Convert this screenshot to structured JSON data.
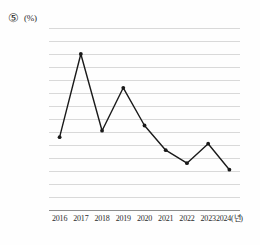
{
  "header": {
    "item_number": "⑤",
    "unit_label": "(%)"
  },
  "chart_data": {
    "type": "line",
    "title": "",
    "xlabel": "",
    "ylabel": "(%)",
    "x_axis_unit": "(년)",
    "categories": [
      "2016",
      "2017",
      "2018",
      "2019",
      "2020",
      "2021",
      "2022",
      "2023",
      "2024"
    ],
    "tick_labels": [
      "2016",
      "2017",
      "2018",
      "2019",
      "2020",
      "2021",
      "2022",
      "2023",
      "2024(년)"
    ],
    "values": [
      56,
      120,
      61,
      94,
      65,
      46,
      36,
      51,
      31
    ],
    "ylim": [
      0,
      140
    ],
    "ytick_step": 10,
    "ytick_labels": [
      "140",
      "130",
      "120",
      "110",
      "100",
      "90",
      "80",
      "70",
      "60",
      "50",
      "40",
      "30",
      "20",
      "10",
      "0"
    ],
    "grid": true,
    "legend": "none",
    "marker": "circle",
    "line_color": "#1a1a1a",
    "marker_color": "#1a1a1a",
    "grid_color": "#d9d9d9",
    "baseline_color": "#8d8d8d"
  }
}
